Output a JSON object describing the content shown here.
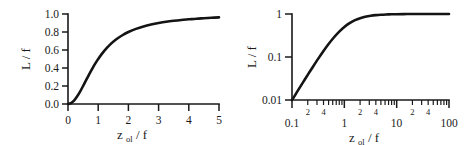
{
  "figure": {
    "background_color": "#ffffff",
    "line_color": "#141414",
    "axis_color": "#1a1a1a"
  },
  "chart_data": [
    {
      "type": "line",
      "panel": "left",
      "title": "",
      "xlabel": "z_ol / f",
      "xlabel_main": "z",
      "xlabel_subscript": "ol",
      "xlabel_tail": " / f",
      "ylabel": "L / f",
      "xscale": "linear",
      "yscale": "linear",
      "xlim": [
        0,
        5
      ],
      "ylim": [
        0,
        1.0
      ],
      "grid": false,
      "legend": "none",
      "xticks": [
        0,
        1,
        2,
        3,
        4,
        5
      ],
      "xticklabels": [
        "0",
        "1",
        "2",
        "3",
        "4",
        "5"
      ],
      "yticks": [
        0.0,
        0.2,
        0.4,
        0.6,
        0.8,
        1.0
      ],
      "yticklabels": [
        "0.0",
        "0.2",
        "0.4",
        "0.6",
        "0.8",
        "1.0"
      ],
      "series": [
        {
          "name": "L/f",
          "x": [
            0.0,
            0.1,
            0.2,
            0.3,
            0.4,
            0.5,
            0.6,
            0.7,
            0.8,
            0.9,
            1.0,
            1.2,
            1.4,
            1.6,
            1.8,
            2.0,
            2.25,
            2.5,
            2.75,
            3.0,
            3.25,
            3.5,
            3.75,
            4.0,
            4.25,
            4.5,
            4.75,
            5.0
          ],
          "y": [
            0.0,
            0.01,
            0.038,
            0.083,
            0.138,
            0.2,
            0.265,
            0.329,
            0.39,
            0.448,
            0.5,
            0.59,
            0.662,
            0.719,
            0.764,
            0.8,
            0.835,
            0.862,
            0.883,
            0.9,
            0.914,
            0.925,
            0.934,
            0.941,
            0.948,
            0.953,
            0.958,
            0.962
          ]
        }
      ]
    },
    {
      "type": "line",
      "panel": "right",
      "title": "",
      "xlabel": "z_ol / f",
      "xlabel_main": "z",
      "xlabel_subscript": "ol",
      "xlabel_tail": " / f",
      "ylabel": "L / f",
      "xscale": "log",
      "yscale": "log",
      "xlim": [
        0.1,
        100
      ],
      "ylim": [
        0.01,
        1
      ],
      "grid": false,
      "legend": "none",
      "xticks": [
        0.1,
        1,
        10,
        100
      ],
      "xticklabels": [
        "0.1",
        "1",
        "10",
        "100"
      ],
      "xminorticklabels": [
        "2",
        "4"
      ],
      "yticks": [
        0.01,
        0.1,
        1
      ],
      "yticklabels": [
        "0.01",
        "0.1",
        "1"
      ],
      "series": [
        {
          "name": "L/f",
          "x": [
            0.1,
            0.13,
            0.16,
            0.2,
            0.25,
            0.32,
            0.4,
            0.5,
            0.63,
            0.8,
            1.0,
            1.26,
            1.6,
            2.0,
            2.5,
            3.2,
            4.0,
            5.0,
            6.3,
            8.0,
            10.0,
            16.0,
            25.0,
            40.0,
            63.0,
            100.0
          ],
          "y": [
            0.0099,
            0.0167,
            0.025,
            0.0385,
            0.0588,
            0.0929,
            0.1379,
            0.2,
            0.2841,
            0.3902,
            0.5,
            0.6135,
            0.7191,
            0.8,
            0.8621,
            0.911,
            0.9412,
            0.9615,
            0.9755,
            0.9846,
            0.9901,
            0.9961,
            0.9984,
            0.9994,
            0.9997,
            0.9999
          ]
        }
      ]
    }
  ]
}
